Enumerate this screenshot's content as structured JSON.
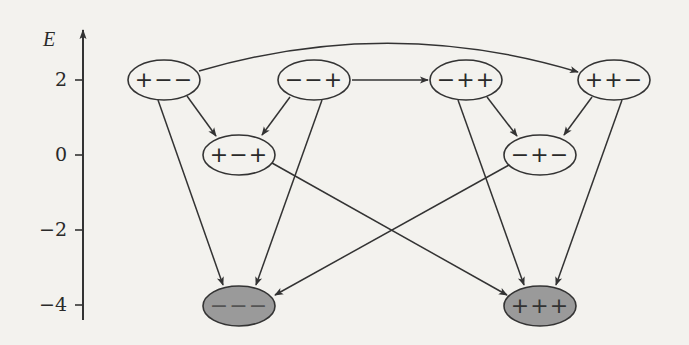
{
  "diagram": {
    "type": "energy-level transition graph",
    "axis": {
      "label": "E",
      "ticks": [
        {
          "value": 2,
          "label": "2"
        },
        {
          "value": 0,
          "label": "0"
        },
        {
          "value": -2,
          "label": "−2"
        },
        {
          "value": -4,
          "label": "−4"
        }
      ]
    },
    "colors": {
      "stroke": "#333333",
      "node_fill": "#f3f2ee",
      "ground_fill": "#9a9a9a",
      "background": "#f3f2ee"
    },
    "nodes": [
      {
        "id": "pmm",
        "label": "+−−",
        "energy": 2,
        "shaded": false
      },
      {
        "id": "mmp",
        "label": "−−+",
        "energy": 2,
        "shaded": false
      },
      {
        "id": "mpp",
        "label": "−++",
        "energy": 2,
        "shaded": false
      },
      {
        "id": "ppm",
        "label": "++−",
        "energy": 2,
        "shaded": false
      },
      {
        "id": "pmp",
        "label": "+−+",
        "energy": 0,
        "shaded": false
      },
      {
        "id": "mpm",
        "label": "−+−",
        "energy": 0,
        "shaded": false
      },
      {
        "id": "mmm",
        "label": "−−−",
        "energy": -4,
        "shaded": true
      },
      {
        "id": "ppp",
        "label": "+++",
        "energy": -4,
        "shaded": true
      }
    ],
    "edges": [
      {
        "from": "pmm",
        "to": "ppm",
        "curved": true
      },
      {
        "from": "mmp",
        "to": "mpp"
      },
      {
        "from": "pmm",
        "to": "pmp"
      },
      {
        "from": "mmp",
        "to": "pmp"
      },
      {
        "from": "mpp",
        "to": "mpm"
      },
      {
        "from": "ppm",
        "to": "mpm"
      },
      {
        "from": "pmm",
        "to": "mmm"
      },
      {
        "from": "mmp",
        "to": "mmm"
      },
      {
        "from": "mpm",
        "to": "mmm"
      },
      {
        "from": "pmp",
        "to": "ppp"
      },
      {
        "from": "mpp",
        "to": "ppp"
      },
      {
        "from": "ppm",
        "to": "ppp"
      }
    ]
  }
}
